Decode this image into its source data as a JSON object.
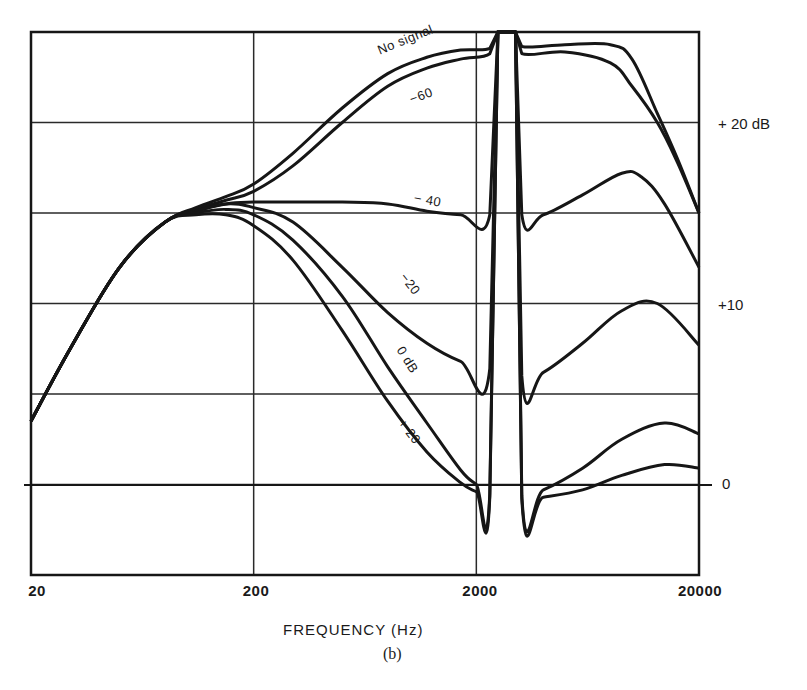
{
  "chart_data": {
    "type": "line",
    "title": "",
    "caption": "(b)",
    "xlabel": "FREQUENCY (Hz)",
    "ylabel": "",
    "xscale": "log",
    "xlim": [
      20,
      20000
    ],
    "ylim": [
      -5,
      25
    ],
    "grid": true,
    "x_ticks": [
      {
        "value": 20,
        "label": "20"
      },
      {
        "value": 200,
        "label": "200"
      },
      {
        "value": 2000,
        "label": "2000"
      },
      {
        "value": 20000,
        "label": "20000"
      }
    ],
    "y_ticks": [
      {
        "value": 20,
        "label": "+ 20 dB"
      },
      {
        "value": 10,
        "label": "+10"
      },
      {
        "value": 0,
        "label": "0"
      }
    ],
    "y_gridlines": [
      0,
      5,
      10,
      15,
      20
    ],
    "notch": {
      "low_hz": 2550,
      "high_hz": 2950,
      "description": "deep notch between approximately 2.5 and 3 kHz"
    },
    "series": [
      {
        "name": "No signal",
        "x": [
          20,
          30,
          50,
          80,
          110,
          150,
          200,
          300,
          500,
          800,
          1200,
          1700,
          2300,
          2500,
          3000,
          3200,
          5000,
          8000,
          10000,
          13000,
          16000,
          20000
        ],
        "y": [
          3.5,
          7.5,
          12,
          14.5,
          15.3,
          15.9,
          16.6,
          18.3,
          20.8,
          22.7,
          23.6,
          24.0,
          24.1,
          25,
          25,
          24.2,
          24.3,
          24.3,
          23.5,
          20.5,
          18.0,
          15.0
        ]
      },
      {
        "name": "-60",
        "x": [
          20,
          30,
          50,
          80,
          110,
          150,
          200,
          300,
          500,
          800,
          1200,
          1700,
          2300,
          2500,
          3000,
          3200,
          5000,
          8000,
          10000,
          13000,
          16000,
          20000
        ],
        "y": [
          3.5,
          7.5,
          12,
          14.5,
          15.2,
          15.7,
          16.2,
          17.6,
          20.0,
          22.0,
          23.0,
          23.5,
          23.8,
          25,
          25,
          23.8,
          23.9,
          23.3,
          22.0,
          20.0,
          17.8,
          15.0
        ]
      },
      {
        "name": "-40",
        "x": [
          20,
          30,
          50,
          80,
          110,
          150,
          200,
          300,
          500,
          800,
          1200,
          1700,
          2300,
          2500,
          3000,
          3200,
          4000,
          6000,
          9000,
          11000,
          14000,
          20000
        ],
        "y": [
          3.5,
          7.5,
          12,
          14.5,
          15.1,
          15.5,
          15.6,
          15.6,
          15.6,
          15.5,
          15.1,
          14.9,
          14.9,
          25,
          25,
          14.9,
          14.9,
          16.0,
          17.2,
          17.0,
          15.5,
          12.0
        ]
      },
      {
        "name": "-20",
        "x": [
          20,
          30,
          50,
          80,
          110,
          150,
          200,
          300,
          500,
          800,
          1200,
          1700,
          2300,
          2500,
          3000,
          3200,
          4000,
          6000,
          9000,
          13000,
          20000
        ],
        "y": [
          3.5,
          7.5,
          12,
          14.5,
          15.1,
          15.5,
          15.3,
          14.5,
          12.0,
          9.5,
          7.8,
          6.8,
          6.4,
          25,
          25,
          6.0,
          6.2,
          7.8,
          9.6,
          10.0,
          7.7
        ]
      },
      {
        "name": "0 dB",
        "x": [
          20,
          30,
          50,
          80,
          110,
          150,
          200,
          300,
          500,
          800,
          1200,
          1700,
          2000,
          2300,
          2500,
          3000,
          3200,
          4000,
          6000,
          9000,
          14000,
          20000
        ],
        "y": [
          3.5,
          7.5,
          12,
          14.5,
          15.0,
          15.2,
          14.9,
          13.5,
          10.4,
          6.5,
          3.4,
          0.8,
          0.0,
          -0.5,
          25,
          25,
          -0.6,
          -0.3,
          0.9,
          2.5,
          3.4,
          2.8
        ]
      },
      {
        "name": "+20",
        "x": [
          20,
          30,
          50,
          80,
          110,
          150,
          200,
          300,
          500,
          800,
          1200,
          1700,
          2000,
          2300,
          2500,
          3000,
          3200,
          4000,
          6000,
          9000,
          14000,
          20000
        ],
        "y": [
          3.5,
          7.5,
          12,
          14.5,
          14.9,
          14.9,
          14.3,
          12.4,
          8.5,
          4.6,
          1.8,
          0.1,
          -0.4,
          -0.7,
          25,
          25,
          -0.8,
          -0.7,
          -0.3,
          0.5,
          1.1,
          0.9
        ]
      }
    ],
    "annotations": [
      {
        "text": "No signal",
        "series": "No signal"
      },
      {
        "text": "−60",
        "series": "-60"
      },
      {
        "text": "− 40",
        "series": "-40"
      },
      {
        "text": "−20",
        "series": "-20"
      },
      {
        "text": "0 dB",
        "series": "0 dB"
      },
      {
        "text": "+ 20",
        "series": "+20"
      }
    ]
  },
  "labels": {
    "x_ticks": [
      "20",
      "200",
      "2000",
      "20000"
    ],
    "y_ticks": [
      "+ 20 dB",
      "+10",
      "0"
    ],
    "xlabel": "FREQUENCY (Hz)",
    "caption": "(b)",
    "curve_labels": [
      "No signal",
      "−60",
      "− 40",
      "−20",
      "0 dB",
      "+ 20"
    ]
  },
  "style": {
    "line_color": "#161616",
    "grid_color": "#2a2a2a",
    "background": "#ffffff"
  }
}
